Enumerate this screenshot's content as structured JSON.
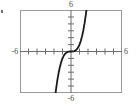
{
  "figure": {
    "name": "cubic-function-graph",
    "background_color": "#ffffff",
    "frame_color": "#9a9a9a",
    "axis_color": "#6b6b6b",
    "curve_color": "#1a1a1a",
    "label_color": "#4a4a4a",
    "edge_mark": "•"
  },
  "labels": {
    "top": "6",
    "bottom": "-6",
    "left": "-6",
    "right": "6"
  },
  "chart_data": {
    "type": "line",
    "title": "",
    "subtitle": "",
    "xlabel": "",
    "ylabel": "",
    "xlim": [
      -6,
      6
    ],
    "ylim": [
      -6,
      6
    ],
    "grid": false,
    "legend": false,
    "legend_position": "none",
    "x_tick_labels": [
      "-6",
      "6"
    ],
    "y_tick_labels": [
      "-6",
      "6"
    ],
    "x_ticks": [
      -5,
      -4,
      -3,
      -2,
      -1,
      1,
      2,
      3,
      4,
      5
    ],
    "y_ticks": [
      -5,
      -4,
      -3,
      -2,
      -1,
      1,
      2,
      3,
      4,
      5
    ],
    "annotations": [],
    "series": [
      {
        "name": "cubic curve",
        "x": [
          -1.85,
          -1.75,
          -1.6,
          -1.45,
          -1.3,
          -1.15,
          -1.0,
          -0.85,
          -0.7,
          -0.55,
          -0.4,
          -0.25,
          -0.1,
          0.0,
          0.1,
          0.25,
          0.4,
          0.55,
          0.7,
          0.85,
          1.0,
          1.15,
          1.3,
          1.45,
          1.6,
          1.75,
          1.85
        ],
        "y": [
          -6.33,
          -5.36,
          -4.1,
          -3.05,
          -2.2,
          -1.52,
          -1.0,
          -0.61,
          -0.34,
          -0.17,
          -0.06,
          -0.016,
          -0.001,
          0.0,
          0.001,
          0.016,
          0.06,
          0.17,
          0.34,
          0.61,
          1.0,
          1.52,
          2.2,
          3.05,
          4.1,
          5.36,
          6.33
        ]
      }
    ]
  }
}
